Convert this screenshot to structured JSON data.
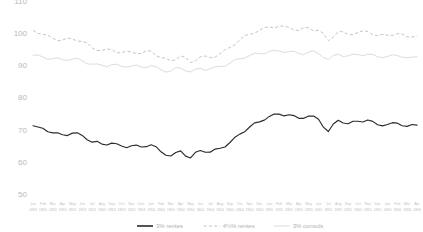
{
  "chart_data": {
    "type": "line",
    "title": "",
    "xlabel": "",
    "ylabel": "",
    "ylim": [
      50,
      110
    ],
    "yticks": [
      110,
      100,
      90,
      80,
      70,
      60,
      50
    ],
    "grid": false,
    "legend_position": "bottom",
    "x_tick_months": [
      "Jan",
      "Feb",
      "Mar",
      "Apr",
      "May",
      "Jun",
      "Jul",
      "Aug",
      "Sep",
      "Oct",
      "Nov",
      "Dec",
      "Jan",
      "Feb",
      "Mar",
      "Apr",
      "May",
      "Jun",
      "Jul",
      "Aug",
      "Sep",
      "Oct",
      "Nov",
      "Dec",
      "Jan",
      "Feb",
      "Mar",
      "Apr",
      "May",
      "Jun",
      "Jul",
      "Aug",
      "Sep",
      "Oct",
      "Nov",
      "Dec",
      "Jan",
      "Feb",
      "Mar",
      "Apr"
    ],
    "x_tick_years": [
      "1863",
      "1863",
      "1863",
      "1863",
      "1863",
      "1863",
      "1863",
      "1863",
      "1863",
      "1863",
      "1863",
      "1863",
      "1864",
      "1864",
      "1864",
      "1864",
      "1864",
      "1864",
      "1864",
      "1864",
      "1864",
      "1864",
      "1864",
      "1864",
      "1865",
      "1865",
      "1865",
      "1865",
      "1865",
      "1865",
      "1865",
      "1865",
      "1865",
      "1865",
      "1865",
      "1865",
      "1866",
      "1866",
      "1866",
      "1866"
    ],
    "series": [
      {
        "name": "3% rentes",
        "style": "solid",
        "color": "#2b2b2b",
        "values": [
          71.2,
          70.4,
          69.0,
          68.4,
          68.9,
          68.2,
          66.1,
          65.5,
          65.8,
          64.9,
          65.0,
          64.6,
          65.3,
          63.1,
          61.8,
          63.4,
          61.2,
          63.5,
          63.0,
          64.2,
          66.0,
          68.6,
          70.8,
          72.4,
          74.1,
          74.8,
          74.6,
          73.5,
          74.2,
          73.2,
          69.4,
          72.9,
          71.8,
          72.6,
          73.0,
          71.5,
          71.6,
          72.0,
          71.0,
          71.4
        ]
      },
      {
        "name": "4½% rentes",
        "style": "dashed",
        "color": "#c4c4c4",
        "values": [
          100.8,
          99.6,
          98.4,
          97.8,
          98.2,
          97.4,
          95.4,
          94.6,
          94.9,
          93.9,
          94.1,
          93.6,
          94.4,
          92.3,
          91.4,
          92.9,
          90.8,
          92.6,
          92.4,
          93.6,
          95.5,
          97.9,
          99.6,
          100.8,
          101.9,
          102.1,
          101.7,
          100.8,
          101.6,
          100.8,
          97.6,
          100.4,
          99.6,
          100.2,
          100.5,
          99.2,
          99.3,
          99.8,
          98.8,
          99.2
        ]
      },
      {
        "name": "3% consols",
        "style": "solid-light",
        "color": "#dcdcdc",
        "values": [
          93.1,
          92.6,
          92.0,
          91.7,
          91.9,
          91.4,
          90.3,
          90.0,
          90.2,
          89.6,
          89.7,
          89.4,
          89.9,
          88.6,
          88.2,
          89.1,
          87.9,
          89.0,
          88.9,
          89.6,
          90.6,
          92.0,
          93.0,
          93.6,
          94.3,
          94.4,
          94.2,
          93.6,
          94.1,
          93.6,
          91.8,
          93.4,
          92.9,
          93.3,
          93.4,
          92.6,
          92.7,
          93.0,
          92.4,
          92.6
        ]
      }
    ],
    "legend": [
      {
        "label": "3% rentes",
        "style": "solid",
        "color": "#2b2b2b"
      },
      {
        "label": "4½% rentes",
        "style": "dashed",
        "color": "#c4c4c4"
      },
      {
        "label": "3% consols",
        "style": "solid-light",
        "color": "#dcdcdc"
      }
    ]
  },
  "axis": {
    "y_label_color": "#b9b9b9",
    "x_label_color": "#c2c2c2"
  }
}
